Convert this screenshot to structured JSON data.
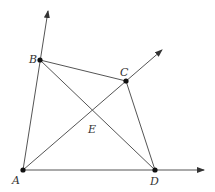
{
  "diagram": {
    "type": "geometry",
    "points": [
      {
        "id": "A",
        "label": "A",
        "x": 23,
        "y": 170,
        "lx": 12,
        "ly": 184
      },
      {
        "id": "B",
        "label": "B",
        "x": 40,
        "y": 60,
        "lx": 29,
        "ly": 63
      },
      {
        "id": "C",
        "label": "C",
        "x": 126,
        "y": 81,
        "lx": 120,
        "ly": 76
      },
      {
        "id": "D",
        "label": "D",
        "x": 155,
        "y": 170,
        "lx": 150,
        "ly": 185
      },
      {
        "id": "E",
        "label": "E",
        "x": 92,
        "y": 118,
        "lx": 88,
        "ly": 133
      }
    ],
    "segments": [
      {
        "from": "B",
        "to": "C"
      },
      {
        "from": "C",
        "to": "D"
      },
      {
        "from": "B",
        "to": "D"
      }
    ],
    "rays": [
      {
        "from": "A",
        "through": "B",
        "tip": [
          48,
          11
        ]
      },
      {
        "from": "A",
        "through": "D",
        "tip": [
          204,
          170
        ]
      },
      {
        "from": "A",
        "through": "C",
        "tip": [
          162,
          50
        ]
      }
    ],
    "intersection": {
      "label": "E",
      "of": [
        "AC",
        "BD"
      ]
    },
    "colors": {
      "line": "#555555",
      "point": "#111111",
      "text": "#333333"
    }
  }
}
